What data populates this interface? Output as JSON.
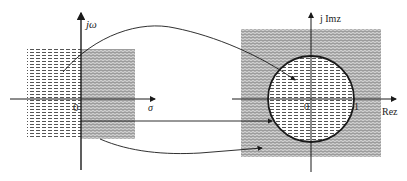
{
  "left_plane": {
    "title": "s-plane",
    "vertical_axis_label": "jω",
    "horizontal_axis_label": "σ",
    "origin_label": "0",
    "regions": [
      {
        "name": "left-half-plane",
        "pattern": "dashed-horizontal"
      },
      {
        "name": "right-half-plane",
        "pattern": "wavy"
      }
    ]
  },
  "right_plane": {
    "title": "z-plane",
    "vertical_axis_label": "j Imz",
    "horizontal_axis_label": "Rez",
    "origin_label": "0",
    "unit_label": "1",
    "regions": [
      {
        "name": "inside-unit-circle",
        "pattern": "dashed-horizontal"
      },
      {
        "name": "outside-unit-circle",
        "pattern": "wavy"
      }
    ]
  },
  "mappings": [
    {
      "from": "left-half-plane",
      "to": "inside-unit-circle"
    },
    {
      "from": "imaginary-axis",
      "to": "unit-circle"
    },
    {
      "from": "right-half-plane",
      "to": "outside-unit-circle"
    }
  ],
  "colors": {
    "line": "#1a1a1a",
    "hatch": "#555555",
    "wavy": "#7a7a7a",
    "background": "#ffffff"
  }
}
